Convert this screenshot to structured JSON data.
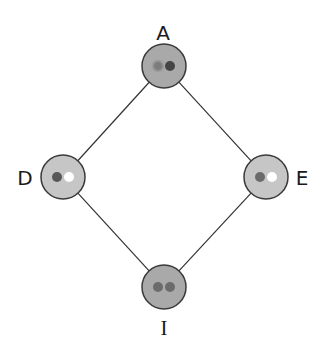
{
  "diagram": {
    "title": "",
    "nodes": [
      {
        "id": "A",
        "label": "A",
        "cx": 164,
        "cy": 66,
        "r": 22,
        "fill": "#a9a9a9",
        "stroke": "#3a3a3a",
        "dots": [
          {
            "color": "#7c7c7c",
            "blur": true
          },
          {
            "color": "#454545",
            "blur": false
          }
        ],
        "label_x": 163,
        "label_y": 33,
        "label_font": "sans"
      },
      {
        "id": "D",
        "label": "D",
        "cx": 63,
        "cy": 177,
        "r": 22,
        "fill": "#c6c6c6",
        "stroke": "#3a3a3a",
        "dots": [
          {
            "color": "#575757",
            "blur": false
          },
          {
            "color": "#ffffff",
            "blur": false
          }
        ],
        "label_x": 25,
        "label_y": 178,
        "label_font": "sans"
      },
      {
        "id": "E",
        "label": "E",
        "cx": 266,
        "cy": 177,
        "r": 22,
        "fill": "#c6c6c6",
        "stroke": "#3a3a3a",
        "dots": [
          {
            "color": "#6a6a6a",
            "blur": false
          },
          {
            "color": "#ffffff",
            "blur": false
          }
        ],
        "label_x": 302,
        "label_y": 178,
        "label_font": "sans"
      },
      {
        "id": "I",
        "label": "I",
        "cx": 164,
        "cy": 287,
        "r": 22,
        "fill": "#a9a9a9",
        "stroke": "#3a3a3a",
        "dots": [
          {
            "color": "#6b6b6b",
            "blur": false
          },
          {
            "color": "#6b6b6b",
            "blur": false
          }
        ],
        "label_x": 164,
        "label_y": 328,
        "label_font": "serif"
      }
    ],
    "edges": [
      {
        "from": "A",
        "to": "D"
      },
      {
        "from": "A",
        "to": "E"
      },
      {
        "from": "D",
        "to": "I"
      },
      {
        "from": "E",
        "to": "I"
      }
    ],
    "edge_color": "#333333",
    "dot_radius": 5,
    "dot_offset": 6
  }
}
